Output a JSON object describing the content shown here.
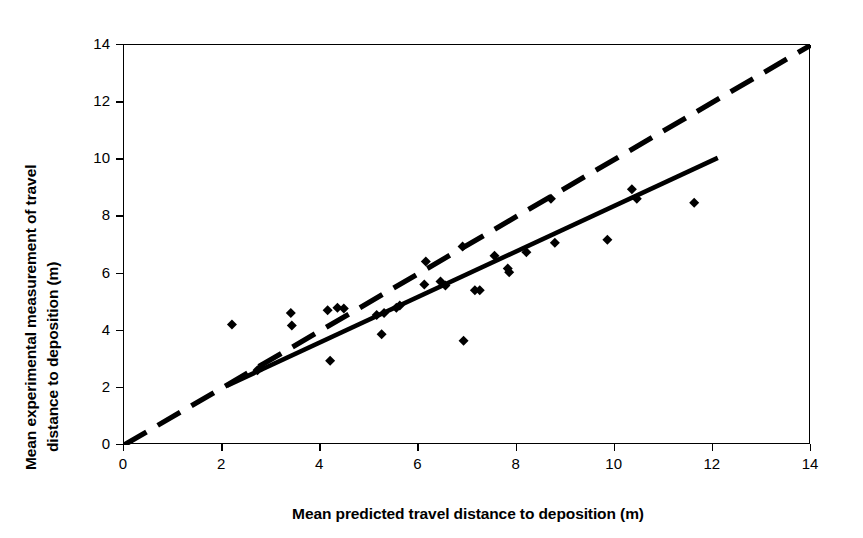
{
  "chart_data": {
    "type": "scatter",
    "title": "",
    "xlabel": "Mean predicted travel distance to deposition (m)",
    "ylabel_line1": "Mean experimental measurement of travel",
    "ylabel_line2": "distance to deposition (m)",
    "xlim": [
      0,
      14
    ],
    "ylim": [
      0,
      14
    ],
    "xticks": [
      0,
      2,
      4,
      6,
      8,
      10,
      12,
      14
    ],
    "yticks": [
      0,
      2,
      4,
      6,
      8,
      10,
      12,
      14
    ],
    "grid": false,
    "legend": "none",
    "marker": "filled-diamond",
    "marker_color": "#000000",
    "points": [
      {
        "x": 2.2,
        "y": 4.22
      },
      {
        "x": 2.72,
        "y": 2.62
      },
      {
        "x": 2.8,
        "y": 2.72
      },
      {
        "x": 3.4,
        "y": 4.62
      },
      {
        "x": 3.42,
        "y": 4.18
      },
      {
        "x": 4.15,
        "y": 4.72
      },
      {
        "x": 4.35,
        "y": 4.8
      },
      {
        "x": 4.48,
        "y": 4.78
      },
      {
        "x": 4.2,
        "y": 2.95
      },
      {
        "x": 5.15,
        "y": 4.55
      },
      {
        "x": 5.3,
        "y": 4.62
      },
      {
        "x": 5.25,
        "y": 3.88
      },
      {
        "x": 5.55,
        "y": 4.8
      },
      {
        "x": 5.62,
        "y": 4.88
      },
      {
        "x": 6.15,
        "y": 6.42
      },
      {
        "x": 6.12,
        "y": 5.62
      },
      {
        "x": 6.45,
        "y": 5.72
      },
      {
        "x": 6.55,
        "y": 5.58
      },
      {
        "x": 6.9,
        "y": 6.95
      },
      {
        "x": 6.92,
        "y": 3.65
      },
      {
        "x": 7.15,
        "y": 5.42
      },
      {
        "x": 7.25,
        "y": 5.42
      },
      {
        "x": 7.55,
        "y": 6.62
      },
      {
        "x": 7.82,
        "y": 6.18
      },
      {
        "x": 7.85,
        "y": 6.05
      },
      {
        "x": 8.2,
        "y": 6.75
      },
      {
        "x": 8.7,
        "y": 8.62
      },
      {
        "x": 8.78,
        "y": 7.08
      },
      {
        "x": 9.85,
        "y": 7.18
      },
      {
        "x": 10.35,
        "y": 8.95
      },
      {
        "x": 10.45,
        "y": 8.62
      },
      {
        "x": 11.62,
        "y": 8.48
      }
    ],
    "lines": [
      {
        "name": "identity-line",
        "style": "dashed",
        "x0": 0.0,
        "y0": 0.0,
        "x1": 14.0,
        "y1": 14.0,
        "color": "#000000"
      },
      {
        "name": "regression-line",
        "style": "solid",
        "x0": 2.1,
        "y0": 2.08,
        "x1": 12.1,
        "y1": 10.05,
        "color": "#000000"
      }
    ]
  }
}
